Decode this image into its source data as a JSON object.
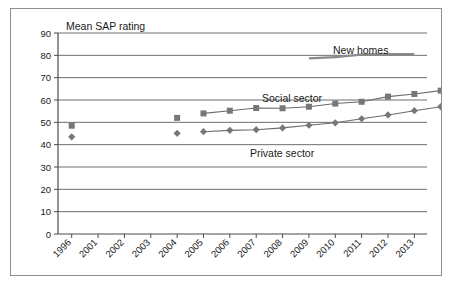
{
  "chart_data": {
    "type": "line",
    "title": "Mean SAP rating",
    "xlabel": "",
    "ylabel": "Mean SAP rating",
    "ylim": [
      0,
      90
    ],
    "ytick_step": 10,
    "yticks": [
      "0",
      "10",
      "20",
      "30",
      "40",
      "50",
      "60",
      "70",
      "80",
      "90"
    ],
    "grid": true,
    "legend_position": "inline-annotations",
    "categories": [
      "1996",
      "2001",
      "2002",
      "2003",
      "2004",
      "2005",
      "2006",
      "2007",
      "2008",
      "2009",
      "2010",
      "2011",
      "2012",
      "2013"
    ],
    "series": [
      {
        "name": "Social sector",
        "marker": "square",
        "color": "#777777",
        "points": [
          {
            "x": "1996",
            "y": 48.5,
            "connected": false
          },
          {
            "x": "2004",
            "y": 52.0,
            "connected": false
          },
          {
            "x": "2005",
            "y": 54.0,
            "connected": true
          },
          {
            "x": "2006",
            "y": 55.2,
            "connected": true
          },
          {
            "x": "2007",
            "y": 56.4,
            "connected": true
          },
          {
            "x": "2008",
            "y": 56.3,
            "connected": true
          },
          {
            "x": "2009",
            "y": 57.0,
            "connected": true
          },
          {
            "x": "2010",
            "y": 58.4,
            "connected": true
          },
          {
            "x": "2011",
            "y": 59.2,
            "connected": true
          },
          {
            "x": "2012",
            "y": 61.5,
            "connected": true
          },
          {
            "x": "2013",
            "y": 62.7,
            "connected": true
          },
          {
            "x": "2013+",
            "y": 64.2,
            "connected": true
          }
        ]
      },
      {
        "name": "Private sector",
        "marker": "diamond",
        "color": "#777777",
        "points": [
          {
            "x": "1996",
            "y": 43.5,
            "connected": false
          },
          {
            "x": "2004",
            "y": 45.1,
            "connected": false
          },
          {
            "x": "2005",
            "y": 45.8,
            "connected": true
          },
          {
            "x": "2006",
            "y": 46.4,
            "connected": true
          },
          {
            "x": "2007",
            "y": 46.7,
            "connected": true
          },
          {
            "x": "2008",
            "y": 47.5,
            "connected": true
          },
          {
            "x": "2009",
            "y": 48.7,
            "connected": true
          },
          {
            "x": "2010",
            "y": 49.8,
            "connected": true
          },
          {
            "x": "2011",
            "y": 51.6,
            "connected": true
          },
          {
            "x": "2012",
            "y": 53.3,
            "connected": true
          },
          {
            "x": "2013",
            "y": 55.2,
            "connected": true
          },
          {
            "x": "2013+",
            "y": 57.0,
            "connected": true
          }
        ]
      },
      {
        "name": "New homes",
        "marker": "none",
        "color": "#8a8a8a",
        "points": [
          {
            "x": "2009",
            "y": 78.6,
            "connected": true
          },
          {
            "x": "2010",
            "y": 79.2,
            "connected": true
          },
          {
            "x": "2011",
            "y": 80.3,
            "connected": true
          },
          {
            "x": "2012",
            "y": 80.5,
            "connected": true
          },
          {
            "x": "2013",
            "y": 80.5,
            "connected": true
          }
        ]
      }
    ],
    "annotations": [
      {
        "label": "New homes",
        "series": "New homes"
      },
      {
        "label": "Social sector",
        "series": "Social sector"
      },
      {
        "label": "Private sector",
        "series": "Private sector"
      }
    ]
  }
}
